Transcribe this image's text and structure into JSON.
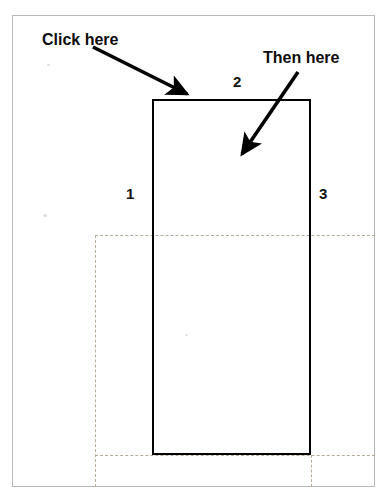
{
  "figure": {
    "clipped_caption": "below left.",
    "callouts": [
      {
        "id": "click-here",
        "text": "Click here"
      },
      {
        "id": "then-here",
        "text": "Then here"
      }
    ],
    "edge_labels": [
      {
        "id": "left-edge",
        "text": "1"
      },
      {
        "id": "top-edge",
        "text": "2"
      },
      {
        "id": "right-edge",
        "text": "3"
      }
    ],
    "colors": {
      "rectangle_stroke": "#000000",
      "guide_line": "#b5ab9c",
      "frame_border": "#b9b9b9",
      "background": "#ffffff",
      "text": "#0d0d0d"
    },
    "geometry": {
      "rectangle": {
        "x": 152,
        "y": 99,
        "width": 159,
        "height": 356
      },
      "frame": {
        "x": 12,
        "y": 15,
        "width": 363,
        "height": 472
      },
      "guides": {
        "horizontal_y": [
          235,
          455
        ],
        "vertical_x": [
          95,
          311
        ]
      },
      "arrows": [
        {
          "id": "click-here-arrow",
          "from": [
            93,
            47
          ],
          "to": [
            190,
            97
          ]
        },
        {
          "id": "then-here-arrow",
          "from": [
            298,
            72
          ],
          "to": [
            238,
            160
          ]
        }
      ]
    }
  }
}
